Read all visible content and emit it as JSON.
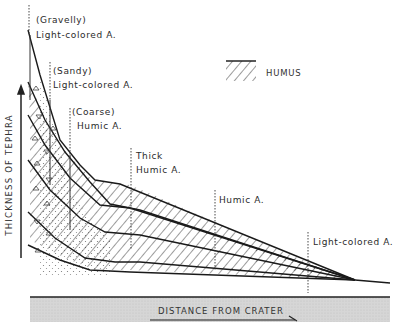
{
  "diagram": {
    "type": "schematic cross-section",
    "y_axis_label": "THICKNESS OF TEPHRA",
    "x_axis_label": "DISTANCE FROM CRATER",
    "legend": {
      "label": "HUMUS",
      "pattern": "diagonal-hatch"
    },
    "zone_labels": [
      {
        "qualifier": "(Gravelly)",
        "name": "Light-colored A."
      },
      {
        "qualifier": "(Sandy)",
        "name": "Light-colored A."
      },
      {
        "qualifier": "(Coarse)",
        "name": "Humic A."
      },
      {
        "qualifier": "Thick",
        "name": "Humic A."
      },
      {
        "qualifier": "",
        "name": "Humic A."
      },
      {
        "qualifier": "",
        "name": "Light-colored A."
      }
    ],
    "colors": {
      "line": "#1a1a1a",
      "ground_fill": "#d9d9d9",
      "background": "#ffffff"
    }
  }
}
